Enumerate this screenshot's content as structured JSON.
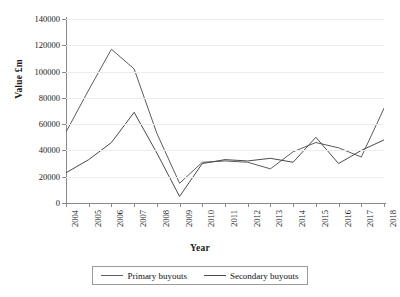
{
  "chart_data": {
    "type": "line",
    "title": "",
    "xlabel": "Year",
    "ylabel": "Value £m",
    "categories": [
      "2004",
      "2005",
      "2006",
      "2007",
      "2008",
      "2009",
      "2010",
      "2011",
      "2012",
      "2013",
      "2014",
      "2015",
      "2016",
      "2017",
      "2018"
    ],
    "x": [
      2004,
      2005,
      2006,
      2007,
      2008,
      2009,
      2010,
      2011,
      2012,
      2013,
      2014,
      2015,
      2016,
      2017,
      2018
    ],
    "ylim": [
      0,
      140000
    ],
    "xlim": [
      2004,
      2018
    ],
    "yticks": [
      0,
      20000,
      40000,
      60000,
      80000,
      100000,
      120000,
      140000
    ],
    "ytick_labels": [
      "0",
      "20000",
      "40000",
      "60000",
      "80000",
      "100000",
      "120000",
      "140000"
    ],
    "grid": true,
    "legend_position": "below",
    "series": [
      {
        "name": "Primary buyouts",
        "color": "#5c5c5c",
        "values": [
          54000,
          86000,
          117000,
          102000,
          53000,
          15000,
          31000,
          32000,
          31000,
          26000,
          39000,
          46000,
          42000,
          35000,
          72000
        ]
      },
      {
        "name": "Secondary buyouts",
        "color": "#4a4a4a",
        "values": [
          23000,
          33000,
          46000,
          69000,
          38000,
          5000,
          30000,
          33000,
          32000,
          34000,
          31000,
          50000,
          30000,
          40000,
          48000
        ]
      }
    ]
  },
  "axes": {
    "y_title": "Value £m",
    "x_title": "Year"
  },
  "legend": {
    "entries": [
      {
        "label": "Primary buyouts"
      },
      {
        "label": "Secondary buyouts"
      }
    ]
  }
}
